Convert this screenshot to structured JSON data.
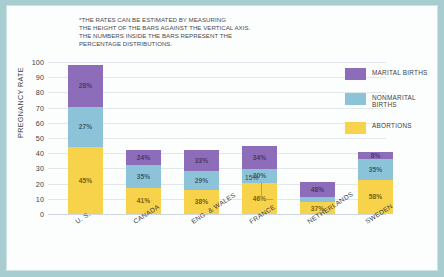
{
  "note": "*THE RATES CAN BE ESTIMATED BY MEASURING\nTHE HEIGHT OF THE BARS AGAINST THE VERTICAL AXIS.\nTHE NUMBERS INSIDE THE BARS REPRESENT THE\nPERCENTAGE DISTRIBUTIONS.",
  "axis": {
    "ylabel": "PREGNANCY RATE",
    "yticks": [
      "100",
      "90",
      "80",
      "70",
      "60",
      "50",
      "40",
      "30",
      "20",
      "10",
      "0"
    ]
  },
  "legend": {
    "items": [
      {
        "label": "MARITAL BIRTHS",
        "color": "#8d6cb9",
        "key": "marital"
      },
      {
        "label": "NONMARITAL\nBIRTHS",
        "color": "#8cc3d8",
        "key": "nonmarital"
      },
      {
        "label": "ABORTIONS",
        "color": "#f7d34c",
        "key": "abortions"
      }
    ]
  },
  "callout": {
    "text": "15%"
  },
  "chart_data": {
    "type": "bar",
    "title": "",
    "subtitle": "",
    "xlabel": "",
    "ylabel": "PREGNANCY RATE",
    "ylim": [
      0,
      100
    ],
    "yticks": [
      0,
      10,
      20,
      30,
      40,
      50,
      60,
      70,
      80,
      90,
      100
    ],
    "grid": true,
    "stacked": true,
    "legend_position": "right",
    "categories": [
      "U. S.",
      "CANADA",
      "ENG. & WALES",
      "FRANCE",
      "NETHERLANDS",
      "SWEDEN"
    ],
    "series": [
      {
        "name": "MARITAL BIRTHS",
        "color": "#8d6cb9",
        "values": [
          28,
          24,
          33,
          34,
          48,
          8
        ]
      },
      {
        "name": "NONMARITAL BIRTHS",
        "color": "#8cc3d8",
        "values": [
          27,
          35,
          29,
          20,
          15,
          35
        ]
      },
      {
        "name": "ABORTIONS",
        "color": "#f7d34c",
        "values": [
          45,
          41,
          38,
          46,
          37,
          58
        ]
      }
    ],
    "bar_totals": [
      98,
      42,
      42,
      45,
      21,
      41
    ],
    "annotations": [
      {
        "text": "15%",
        "target_category": "NETHERLANDS",
        "target_series": "NONMARITAL BIRTHS",
        "note": "callout leader line to thin blue segment"
      }
    ]
  },
  "bars": [
    {
      "name": "U. S.",
      "total": 98,
      "segments": [
        {
          "key": "marital",
          "label": "28%",
          "value": 28
        },
        {
          "key": "nonmarital",
          "label": "27%",
          "value": 27
        },
        {
          "key": "abortions",
          "label": "45%",
          "value": 45
        }
      ]
    },
    {
      "name": "CANADA",
      "total": 42,
      "segments": [
        {
          "key": "marital",
          "label": "24%",
          "value": 24
        },
        {
          "key": "nonmarital",
          "label": "35%",
          "value": 35
        },
        {
          "key": "abortions",
          "label": "41%",
          "value": 41
        }
      ]
    },
    {
      "name": "ENG. & WALES",
      "total": 42,
      "segments": [
        {
          "key": "marital",
          "label": "33%",
          "value": 33
        },
        {
          "key": "nonmarital",
          "label": "29%",
          "value": 29
        },
        {
          "key": "abortions",
          "label": "38%",
          "value": 38
        }
      ]
    },
    {
      "name": "FRANCE",
      "total": 45,
      "segments": [
        {
          "key": "marital",
          "label": "34%",
          "value": 34
        },
        {
          "key": "nonmarital",
          "label": "20%",
          "value": 20
        },
        {
          "key": "abortions",
          "label": "46%",
          "value": 46
        }
      ]
    },
    {
      "name": "NETHERLANDS",
      "total": 21,
      "segments": [
        {
          "key": "marital",
          "label": "48%",
          "value": 48
        },
        {
          "key": "nonmarital",
          "label": "15%",
          "value": 15,
          "tiny": true
        },
        {
          "key": "abortions",
          "label": "37%",
          "value": 37
        }
      ]
    },
    {
      "name": "SWEDEN",
      "total": 41,
      "segments": [
        {
          "key": "marital",
          "label": "8%",
          "value": 8
        },
        {
          "key": "nonmarital",
          "label": "35%",
          "value": 35
        },
        {
          "key": "abortions",
          "label": "58%",
          "value": 58
        }
      ]
    }
  ]
}
